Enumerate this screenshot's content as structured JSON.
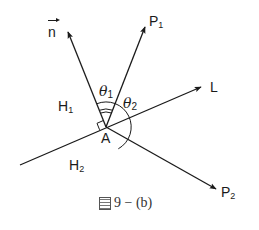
{
  "figure": {
    "caption_prefix_icon": "figure-glyph",
    "caption_text": "9 − (b)",
    "point_label": "A",
    "labels": {
      "normal_vector": "n",
      "p1": "P",
      "p1_sub": "1",
      "p2": "P",
      "p2_sub": "2",
      "line": "L",
      "h1": "H",
      "h1_sub": "1",
      "h2": "H",
      "h2_sub": "2",
      "theta1": "θ",
      "theta1_sub": "1",
      "theta2": "θ",
      "theta2_sub": "2"
    },
    "geometry": {
      "origin_A": [
        106,
        127
      ],
      "normal_tip": [
        67,
        30
      ],
      "p1_tip": [
        146,
        25
      ],
      "line_start": [
        20,
        165
      ],
      "line_tip": [
        203,
        86
      ],
      "p2_tip": [
        218,
        190
      ]
    },
    "colors": {
      "stroke": "#1a1a1a",
      "background": "#ffffff"
    }
  }
}
